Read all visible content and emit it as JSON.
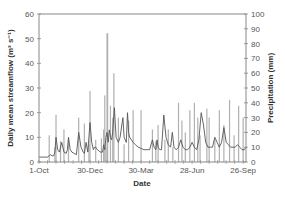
{
  "chart_data": {
    "type": "line",
    "title": "",
    "xlabel": "Date",
    "ylabel": "Daily mean streamflow (m³ s⁻¹)",
    "y2label": "Precipitation (mm)",
    "x_tick_labels": [
      "1-Oct",
      "30-Dec",
      "30-Mar",
      "28-Jun",
      "26-Sep"
    ],
    "x_tick_days": [
      0,
      90,
      180,
      270,
      360
    ],
    "x_range_days": [
      0,
      365
    ],
    "ylim": [
      0,
      60
    ],
    "y_ticks": [
      0,
      10,
      20,
      30,
      40,
      50,
      60
    ],
    "y2lim": [
      0,
      100
    ],
    "y2_ticks": [
      0,
      10,
      20,
      30,
      40,
      50,
      60,
      70,
      80,
      90,
      100
    ],
    "grid": false,
    "legend": "none",
    "colors": {
      "streamflow": "#555555",
      "precipitation": "#b0b0b0",
      "axis": "#888888"
    },
    "series": [
      {
        "name": "Daily mean streamflow",
        "axis": "left",
        "style": "line",
        "days": [
          0,
          5,
          10,
          15,
          18,
          20,
          23,
          26,
          28,
          30,
          33,
          36,
          40,
          44,
          48,
          50,
          52,
          55,
          58,
          62,
          66,
          70,
          74,
          78,
          80,
          83,
          86,
          90,
          93,
          96,
          98,
          100,
          103,
          106,
          108,
          110,
          112,
          114,
          116,
          118,
          120,
          122,
          124,
          126,
          128,
          130,
          133,
          136,
          140,
          143,
          146,
          148,
          150,
          152,
          154,
          156,
          158,
          160,
          163,
          166,
          170,
          175,
          180,
          185,
          190,
          195,
          200,
          203,
          206,
          208,
          210,
          213,
          216,
          220,
          224,
          228,
          232,
          235,
          238,
          242,
          246,
          250,
          254,
          258,
          262,
          266,
          270,
          274,
          278,
          282,
          286,
          290,
          294,
          298,
          302,
          306,
          310,
          314,
          318,
          322,
          326,
          330,
          334,
          338,
          342,
          346,
          350,
          354,
          358,
          362,
          365
        ],
        "values": [
          2,
          2,
          2,
          2,
          2.5,
          3,
          2.5,
          2.5,
          4,
          10,
          5,
          4,
          8,
          4,
          3.5,
          5,
          10,
          5,
          4,
          3.5,
          3,
          12,
          6,
          4,
          3.5,
          8,
          4,
          16,
          8,
          5,
          6,
          6,
          5,
          4.5,
          4,
          4,
          4,
          7,
          5,
          10,
          12,
          8,
          13,
          10,
          9,
          12,
          22,
          10,
          8,
          10,
          15,
          18,
          10,
          9,
          8,
          20,
          12,
          10,
          9,
          8,
          7,
          6,
          5.5,
          5,
          5,
          5,
          9,
          6,
          5,
          9,
          6,
          5,
          5,
          19,
          10,
          7,
          6,
          12,
          6,
          5,
          6,
          9,
          6,
          5,
          5,
          6,
          8,
          6,
          5,
          9,
          20,
          15,
          8,
          6,
          6,
          6,
          10,
          8,
          6,
          8,
          14,
          8,
          7,
          6,
          6,
          6,
          7,
          6,
          5,
          5,
          6
        ]
      },
      {
        "name": "Precipitation",
        "axis": "right",
        "style": "bars",
        "days": [
          18,
          28,
          30,
          38,
          44,
          52,
          70,
          80,
          88,
          90,
          100,
          110,
          114,
          116,
          118,
          120,
          121,
          126,
          130,
          132,
          140,
          150,
          158,
          166,
          180,
          200,
          206,
          210,
          222,
          228,
          236,
          246,
          252,
          258,
          266,
          274,
          280,
          284,
          296,
          300,
          310,
          318,
          326,
          336,
          344,
          352,
          360
        ],
        "values": [
          18,
          10,
          32,
          14,
          22,
          15,
          30,
          26,
          12,
          48,
          15,
          16,
          22,
          45,
          10,
          87,
          87,
          38,
          30,
          60,
          30,
          12,
          28,
          35,
          35,
          22,
          14,
          25,
          15,
          22,
          10,
          40,
          28,
          20,
          35,
          40,
          30,
          18,
          36,
          30,
          15,
          35,
          25,
          42,
          18,
          38,
          30
        ]
      }
    ]
  }
}
